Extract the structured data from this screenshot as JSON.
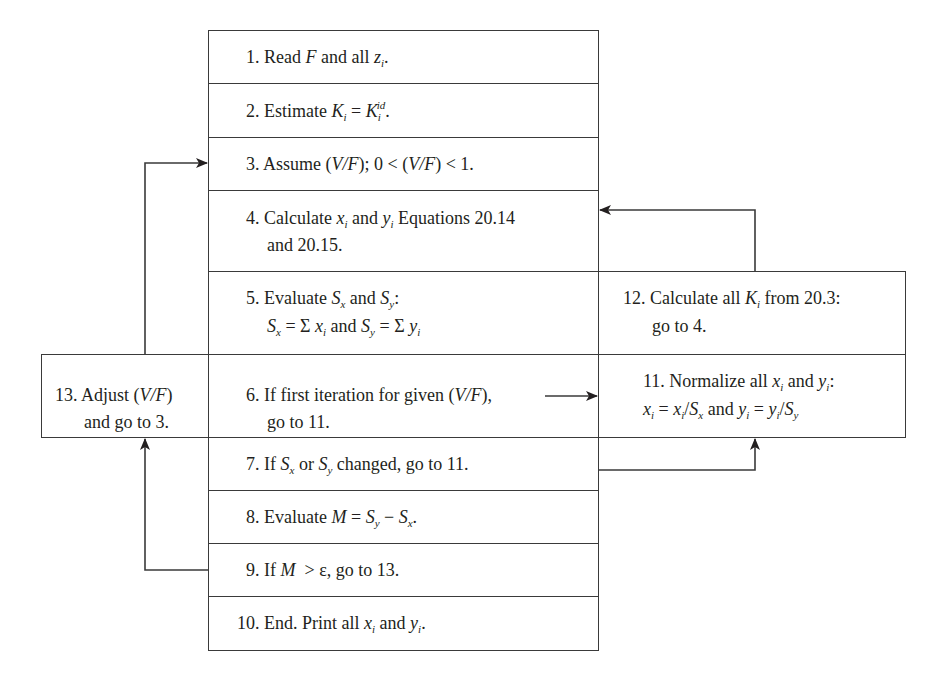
{
  "diagram": {
    "type": "flowchart",
    "steps": [
      {
        "id": 1,
        "label": "1. Read F and all z_i."
      },
      {
        "id": 2,
        "label": "2. Estimate K_i = K_i^id."
      },
      {
        "id": 3,
        "label": "3. Assume (V/F); 0 < (V/F) < 1."
      },
      {
        "id": 4,
        "label": "4. Calculate x_i and y_i Equations 20.14 and 20.15."
      },
      {
        "id": 5,
        "label": "5. Evaluate S_x and S_y: S_x = Σ x_i and S_y = Σ y_i"
      },
      {
        "id": 6,
        "label": "6. If first iteration for given (V/F), go to 11."
      },
      {
        "id": 7,
        "label": "7. If S_x or S_y changed, go to 11."
      },
      {
        "id": 8,
        "label": "8. Evaluate M = S_y − S_x."
      },
      {
        "id": 9,
        "label": "9. If M > ε, go to 13."
      },
      {
        "id": 10,
        "label": "10. End. Print all x_i and y_i."
      },
      {
        "id": 11,
        "label": "11. Normalize all x_i and y_i: x_i = x_i/S_x and y_i = y_i/S_y"
      },
      {
        "id": 12,
        "label": "12. Calculate all K_i from 20.3: go to 4."
      },
      {
        "id": 13,
        "label": "13. Adjust (V/F) and go to 3."
      }
    ],
    "edges": [
      {
        "from": 6,
        "to": 11
      },
      {
        "from": 7,
        "to": 11
      },
      {
        "from": 12,
        "to": 4
      },
      {
        "from": 9,
        "to": 13
      },
      {
        "from": 13,
        "to": 3
      }
    ],
    "text": {
      "s1_a": "1. Read ",
      "s1_F": "F",
      "s1_b": " and all ",
      "s1_z": "z",
      "s1_i": "i",
      "s1_c": ".",
      "s2_a": "2. Estimate ",
      "s2_K": "K",
      "s2_i": "i",
      "s2_eq": " = ",
      "s2_K2": "K",
      "s2_i2": "i",
      "s2_id": "id",
      "s2_c": ".",
      "s3": "3. Assume (",
      "s3_VF": "V/F",
      "s3_b": "); 0 < (",
      "s3_VF2": "V/F",
      "s3_c": ") < 1.",
      "s4_a": "4. Calculate ",
      "s4_x": "x",
      "s4_i": "i",
      "s4_and": " and ",
      "s4_y": "y",
      "s4_i2": "i",
      "s4_b": " Equations  20.14",
      "s4_line2": "and 20.15.",
      "s5_a": "5. Evaluate ",
      "s5_S": "S",
      "s5_x": "x",
      "s5_and": " and ",
      "s5_S2": "S",
      "s5_y": "y",
      "s5_c": ":",
      "s5_l2_S": "S",
      "s5_l2_x": "x",
      "s5_l2_eq": " = Σ ",
      "s5_l2_xi": "x",
      "s5_l2_i": "i",
      "s5_l2_and": " and ",
      "s5_l2_S2": "S",
      "s5_l2_y": "y",
      "s5_l2_eq2": " = Σ ",
      "s5_l2_yi": "y",
      "s5_l2_i2": "i",
      "s6_a": "6. If first iteration for given (",
      "s6_VF": "V/F",
      "s6_b": "),",
      "s6_line2": "go to 11.",
      "s7_a": "7. If ",
      "s7_S": "S",
      "s7_x": "x",
      "s7_or": " or ",
      "s7_S2": "S",
      "s7_y": "y",
      "s7_b": " changed, go to 11.",
      "s8_a": "8. Evaluate ",
      "s8_M": "M",
      "s8_eq": " = ",
      "s8_S": "S",
      "s8_y": "y",
      "s8_minus": " − ",
      "s8_S2": "S",
      "s8_x": "x",
      "s8_c": ".",
      "s9_a": "9. If ",
      "s9_M": "M",
      "s9_b": "  > ε, go to 13.",
      "s10_a": "10. End. Print all ",
      "s10_x": "x",
      "s10_i": "i",
      "s10_and": " and ",
      "s10_y": "y",
      "s10_i2": "i",
      "s10_c": ".",
      "s11_a": "11. Normalize all ",
      "s11_x": "x",
      "s11_i": "i",
      "s11_and": " and ",
      "s11_y": "y",
      "s11_i2": "i",
      "s11_c": ":",
      "s11_l2_x": "x",
      "s11_l2_i": "i",
      "s11_l2_eq": " = ",
      "s11_l2_x2": "x",
      "s11_l2_i2": "i",
      "s11_l2_slash": "/",
      "s11_l2_S": "S",
      "s11_l2_sx": "x",
      "s11_l2_and": " and ",
      "s11_l2_y": "y",
      "s11_l2_i3": "i",
      "s11_l2_eq2": " = ",
      "s11_l2_y2": "y",
      "s11_l2_i4": "i",
      "s11_l2_slash2": "/",
      "s11_l2_S2": "S",
      "s11_l2_sy": "y",
      "s12_a": "12. Calculate all ",
      "s12_K": "K",
      "s12_i": "i",
      "s12_b": " from 20.3:",
      "s12_line2": "go to 4.",
      "s13_a": "13. Adjust (",
      "s13_VF": "V/F",
      "s13_b": ")",
      "s13_line2": "and go to 3."
    },
    "colors": {
      "line": "#3a3a3a",
      "text": "#231f20",
      "background": "#ffffff"
    }
  }
}
